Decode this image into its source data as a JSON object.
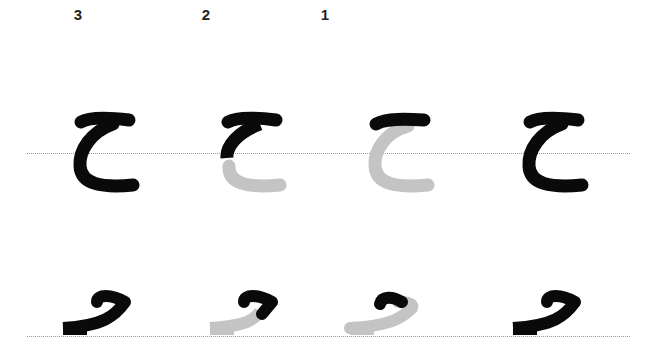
{
  "colors": {
    "ink": "#0a0a0a",
    "pending": "#c4c4c4",
    "guide": "#9a9a9a",
    "label": "#222222"
  },
  "step_labels": [
    {
      "column": 1,
      "text": "3"
    },
    {
      "column": 2,
      "text": "2"
    },
    {
      "column": 3,
      "text": "1"
    }
  ],
  "rows": [
    {
      "form": "isolated",
      "letter": "ح",
      "columns": [
        {
          "step": "3",
          "state": "complete"
        },
        {
          "step": "2",
          "state": "top stroke + upper curve done, lower curve pending"
        },
        {
          "step": "1",
          "state": "top stroke done, rest pending"
        },
        {
          "step": "",
          "state": "final"
        }
      ]
    },
    {
      "form": "final",
      "letter": "ـح",
      "columns": [
        {
          "step": "3",
          "state": "complete"
        },
        {
          "step": "2",
          "state": "hook done, tail pending"
        },
        {
          "step": "1",
          "state": "hook top done, rest pending"
        },
        {
          "step": "",
          "state": "final"
        }
      ]
    }
  ]
}
